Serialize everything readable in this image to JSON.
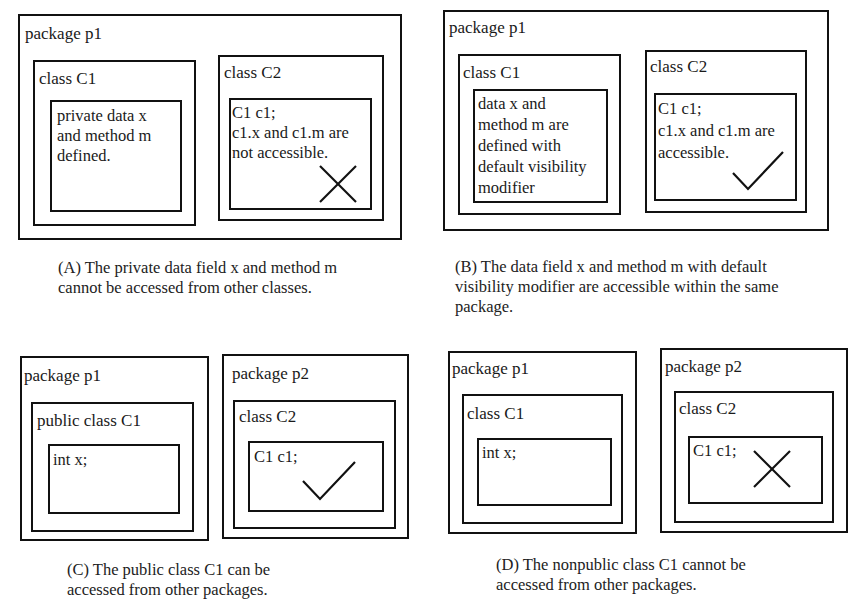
{
  "figure": {
    "panels": [
      {
        "id": "A",
        "packages": [
          {
            "label": "package p1",
            "classes": [
              {
                "label": "class C1",
                "body": "private data x\nand method m\ndefined."
              },
              {
                "label": "class C2",
                "body": "C1 c1;\nc1.x and c1.m are\nnot accessible.",
                "mark": "cross"
              }
            ]
          }
        ],
        "caption": "(A) The private data field x and method m\ncannot be accessed from other classes."
      },
      {
        "id": "B",
        "packages": [
          {
            "label": "package p1",
            "classes": [
              {
                "label": "class C1",
                "body": "data x and\nmethod m  are\ndefined with\ndefault visibility\nmodifier"
              },
              {
                "label": "class C2",
                "body": "C1 c1;\nc1.x and c1.m are\naccessible.",
                "mark": "check"
              }
            ]
          }
        ],
        "caption": "(B) The data field x and method m with default\nvisibility modifier are accessible within the same\npackage."
      },
      {
        "id": "C",
        "packages": [
          {
            "label": "package p1",
            "classes": [
              {
                "label": "public class C1",
                "body": "int x;"
              }
            ]
          },
          {
            "label": "package p2",
            "classes": [
              {
                "label": "class C2",
                "body": "C1 c1;",
                "mark": "check"
              }
            ]
          }
        ],
        "caption": "(C) The public class C1 can be\naccessed from other packages."
      },
      {
        "id": "D",
        "packages": [
          {
            "label": "package p1",
            "classes": [
              {
                "label": "class C1",
                "body": "int x;"
              }
            ]
          },
          {
            "label": "package p2",
            "classes": [
              {
                "label": "class C2",
                "body": "C1 c1;",
                "mark": "cross"
              }
            ]
          }
        ],
        "caption": "(D) The nonpublic class C1 cannot be\naccessed from other packages."
      }
    ],
    "icons": {
      "check": "check-mark-icon",
      "cross": "cross-mark-icon"
    }
  }
}
